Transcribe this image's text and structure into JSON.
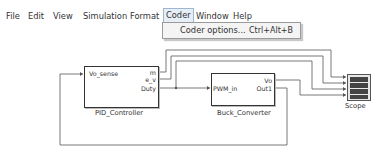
{
  "menu": {
    "items": [
      "File",
      "Edit",
      "View",
      "Simulation",
      "Format",
      "Coder",
      "Window",
      "Help"
    ],
    "active": "Coder"
  },
  "dropdown": {
    "items": [
      {
        "label": "Coder options...",
        "shortcut": "Ctrl+Alt+B"
      }
    ]
  },
  "blocks": {
    "pid": {
      "name": "PID_Controller",
      "inputs": [
        "Vo_sense"
      ],
      "outputs": [
        "m",
        "e_v",
        "Duty"
      ]
    },
    "buck": {
      "name": "Buck_Converter",
      "inputs": [
        "PWM_in"
      ],
      "outputs": [
        "Vo",
        "Out1"
      ]
    },
    "scope": {
      "name": "Scope",
      "input_count": 4
    }
  },
  "colors": {
    "wire": "#555555",
    "menu_highlight": "#e6eef7",
    "menu_highlight_border": "#9fb6cf"
  }
}
